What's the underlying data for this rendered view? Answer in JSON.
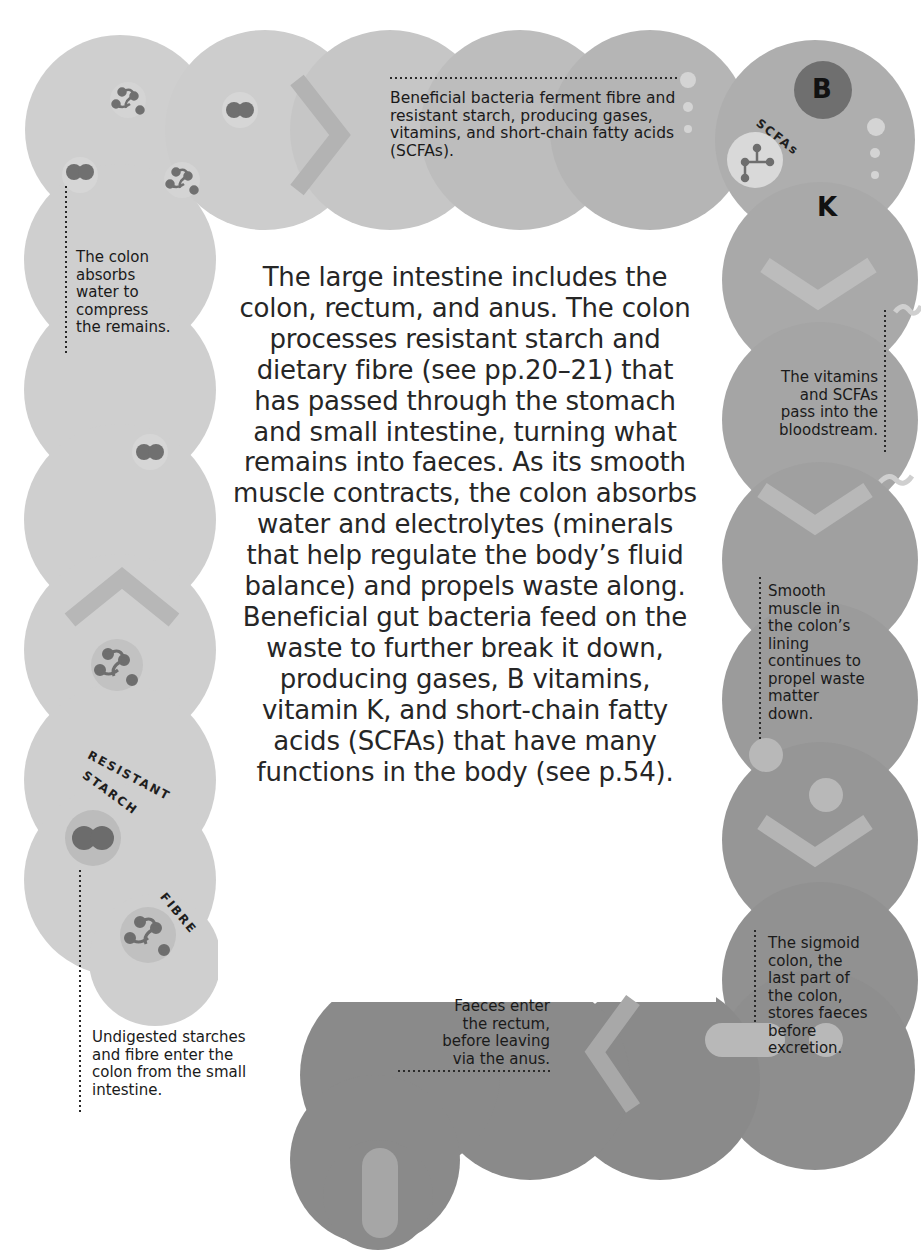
{
  "main": {
    "description": "The large intestine includes the colon, rectum, and anus. The colon processes resistant starch and dietary fibre (see pp.20–21) that has passed through the stomach and small intestine, turning what remains into faeces. As its smooth muscle contracts, the colon absorbs water and electrolytes (minerals that help regulate the body’s fluid balance) and propels waste along. Beneficial gut bacteria feed on the waste to further break it down, producing gases, B vitamins, vitamin K, and short-chain fatty acids (SCFAs) that have many functions in the body (see p.54)."
  },
  "annotations": {
    "bacteria": "Beneficial bacteria ferment fibre and resistant starch, producing gases, vitamins, and short-chain fatty acids (SCFAs).",
    "absorb_water": "The colon absorbs water to compress the remains.",
    "bloodstream": "The vitamins and SCFAs pass into the bloodstream.",
    "smooth_muscle": "Smooth muscle in the colon’s lining continues to propel waste matter down.",
    "sigmoid": "The sigmoid colon, the last part of the colon, stores faeces before excretion.",
    "rectum": "Faeces enter the rectum, before leaving via the anus.",
    "undigested": "Undigested starches and fibre enter the colon from the small intestine."
  },
  "labels": {
    "resistant": "RESISTANT",
    "starch": "STARCH",
    "fibre": "FIBRE",
    "scfas": "SCFAs",
    "vitamin_b": "B",
    "vitamin_k": "K"
  },
  "colors": {
    "tube_light": "#cfcfcf",
    "tube_mid": "#a9a9a9",
    "tube_dark": "#8a8a8a",
    "chevron_light": "#b1b1b1",
    "chevron_dark": "#b8b8b8",
    "molecule": "#727272",
    "vitamin_b_circle": "#6f6f6f",
    "dot_light": "#d9d9d9"
  }
}
